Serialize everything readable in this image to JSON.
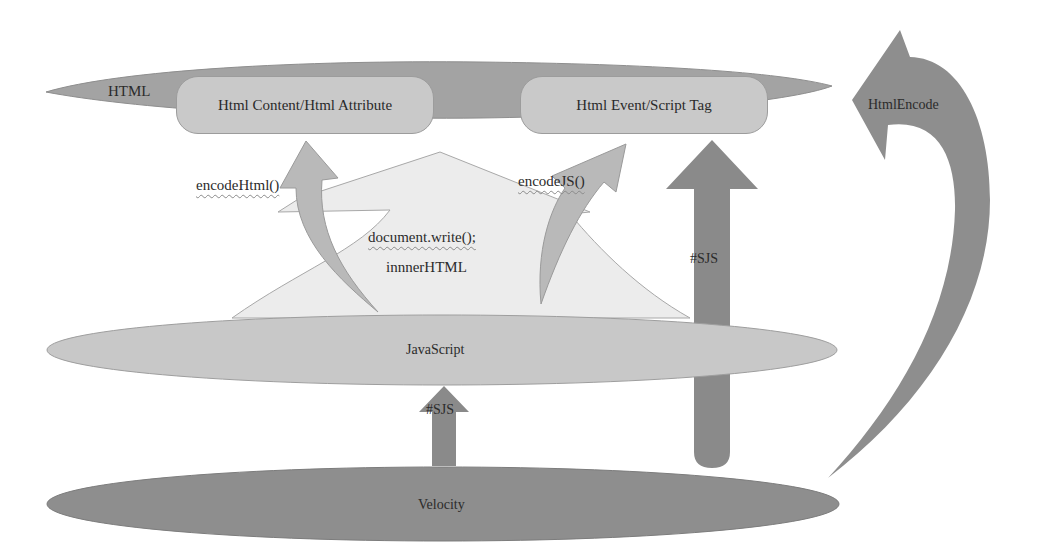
{
  "layers": {
    "html": {
      "label": "HTML",
      "color": "#a3a3a3"
    },
    "javascript": {
      "label": "JavaScript",
      "color": "#c8c8c8"
    },
    "velocity": {
      "label": "Velocity",
      "color": "#8e8e8e"
    }
  },
  "contexts": {
    "html_content": {
      "label": "Html Content/Html Attribute",
      "color": "#c9c9c9"
    },
    "html_event": {
      "label": "Html Event/Script Tag",
      "color": "#c9c9c9"
    }
  },
  "sink": {
    "line1": "document.write();",
    "line2": "innnerHTML",
    "color": "#ececec"
  },
  "arrows": {
    "encode_html": {
      "label": "encodeHtml()"
    },
    "encode_js": {
      "label": "encodeJS()"
    },
    "sjs_to_html": {
      "label": "#SJS"
    },
    "sjs_to_js": {
      "label": "#SJS"
    },
    "html_encode": {
      "label": "HtmlEncode"
    }
  }
}
